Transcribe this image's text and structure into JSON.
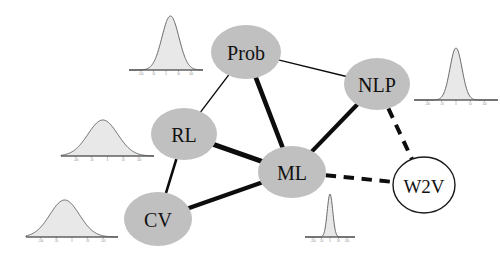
{
  "figure": {
    "background": "#ffffff",
    "width": 500,
    "height": 260,
    "type": "node-link-graph-with-marginal-distributions"
  },
  "style": {
    "node_fill": "#c0c0c0",
    "node_fill_open": "#ffffff",
    "node_stroke": "#1a1a1a",
    "edge_color": "#0d0d0d",
    "label_color": "#111111",
    "dist_fill": "#e8e8e8",
    "dist_stroke": "#5a5a5a",
    "axis_color": "#4a4a4a"
  },
  "nodes": [
    {
      "id": "Prob",
      "label": "Prob",
      "cx": 246,
      "cy": 52,
      "rx": 35,
      "ry": 27,
      "fill": "#c0c0c0",
      "style": "filled",
      "font_size": 20
    },
    {
      "id": "NLP",
      "label": "NLP",
      "cx": 377,
      "cy": 84,
      "rx": 33,
      "ry": 26,
      "fill": "#c0c0c0",
      "style": "filled",
      "font_size": 20
    },
    {
      "id": "RL",
      "label": "RL",
      "cx": 184,
      "cy": 134,
      "rx": 33,
      "ry": 26,
      "fill": "#c0c0c0",
      "style": "filled",
      "font_size": 20
    },
    {
      "id": "ML",
      "label": "ML",
      "cx": 292,
      "cy": 172,
      "rx": 34,
      "ry": 26,
      "fill": "#c0c0c0",
      "style": "filled",
      "font_size": 20
    },
    {
      "id": "CV",
      "label": "CV",
      "cx": 158,
      "cy": 219,
      "rx": 34,
      "ry": 27,
      "fill": "#c0c0c0",
      "style": "filled",
      "font_size": 20
    },
    {
      "id": "W2V",
      "label": "W2V",
      "cx": 424,
      "cy": 185,
      "rx": 31,
      "ry": 28,
      "fill": "#ffffff",
      "style": "open",
      "font_size": 19
    }
  ],
  "edges": [
    {
      "id": "prob-nlp",
      "source": "Prob",
      "target": "NLP",
      "width": 1.4,
      "dashed": false,
      "weight": "thin"
    },
    {
      "id": "prob-rl",
      "source": "Prob",
      "target": "RL",
      "width": 1.4,
      "dashed": false,
      "weight": "thin"
    },
    {
      "id": "prob-ml",
      "source": "Prob",
      "target": "ML",
      "width": 4.6,
      "dashed": false,
      "weight": "thick"
    },
    {
      "id": "rl-ml",
      "source": "RL",
      "target": "ML",
      "width": 5.2,
      "dashed": false,
      "weight": "thick"
    },
    {
      "id": "rl-cv",
      "source": "RL",
      "target": "CV",
      "width": 2.6,
      "dashed": false,
      "weight": "medium"
    },
    {
      "id": "cv-ml",
      "source": "CV",
      "target": "ML",
      "width": 4.2,
      "dashed": false,
      "weight": "thick"
    },
    {
      "id": "ml-nlp",
      "source": "ML",
      "target": "NLP",
      "width": 4.2,
      "dashed": false,
      "weight": "thick"
    },
    {
      "id": "nlp-w2v",
      "source": "NLP",
      "target": "W2V",
      "width": 4.0,
      "dashed": true,
      "weight": "thick-dashed"
    },
    {
      "id": "ml-w2v",
      "source": "ML",
      "target": "W2V",
      "width": 4.0,
      "dashed": true,
      "weight": "thick-dashed"
    }
  ],
  "distributions": [
    {
      "id": "dist-top-left",
      "near_node": "Prob",
      "x": 129,
      "y": 14,
      "w": 74,
      "h": 65,
      "shape": "gaussian",
      "peak_rel": 0.56,
      "spread_rel": 0.115,
      "tick_labels": [
        "-100",
        "-50",
        "0",
        "50",
        "100"
      ]
    },
    {
      "id": "dist-mid-left",
      "near_node": "RL",
      "x": 61,
      "y": 118,
      "w": 93,
      "h": 47,
      "shape": "gaussian",
      "peak_rel": 0.45,
      "spread_rel": 0.16,
      "tick_labels": [
        "-100",
        "-50",
        "0",
        "50",
        "100"
      ]
    },
    {
      "id": "dist-bottom-left",
      "near_node": "CV",
      "x": 26,
      "y": 198,
      "w": 92,
      "h": 48,
      "shape": "gaussian",
      "peak_rel": 0.42,
      "spread_rel": 0.16,
      "tick_labels": [
        "-100",
        "-50",
        "0",
        "50",
        "100"
      ]
    },
    {
      "id": "dist-bottom-center",
      "near_node": "ML",
      "x": 305,
      "y": 192,
      "w": 50,
      "h": 54,
      "shape": "gaussian-narrow",
      "peak_rel": 0.5,
      "spread_rel": 0.055,
      "tick_labels": [
        "-100",
        "-50",
        "0",
        "50",
        "100"
      ]
    },
    {
      "id": "dist-right",
      "near_node": "NLP",
      "x": 414,
      "y": 46,
      "w": 84,
      "h": 63,
      "shape": "gaussian-narrow",
      "peak_rel": 0.5,
      "spread_rel": 0.072,
      "tick_labels": [
        "-100",
        "-50",
        "0",
        "50",
        "100"
      ]
    }
  ],
  "chart_data": {
    "type": "network",
    "title": "",
    "node_ids": [
      "Prob",
      "NLP",
      "RL",
      "ML",
      "CV",
      "W2V"
    ],
    "edge_list": [
      [
        "Prob",
        "NLP"
      ],
      [
        "Prob",
        "RL"
      ],
      [
        "Prob",
        "ML"
      ],
      [
        "RL",
        "ML"
      ],
      [
        "RL",
        "CV"
      ],
      [
        "CV",
        "ML"
      ],
      [
        "ML",
        "NLP"
      ],
      [
        "NLP",
        "W2V"
      ],
      [
        "ML",
        "W2V"
      ]
    ],
    "edge_weights": [
      1.4,
      1.4,
      4.6,
      5.2,
      2.6,
      4.2,
      4.2,
      4.0,
      4.0
    ],
    "edge_styles": [
      "solid",
      "solid",
      "solid",
      "solid",
      "solid",
      "solid",
      "solid",
      "dashed",
      "dashed"
    ],
    "node_degrees": {
      "Prob": 3,
      "NLP": 3,
      "RL": 3,
      "ML": 5,
      "CV": 2,
      "W2V": 2
    },
    "marginal_count": 5,
    "legend": [],
    "grid": false
  }
}
